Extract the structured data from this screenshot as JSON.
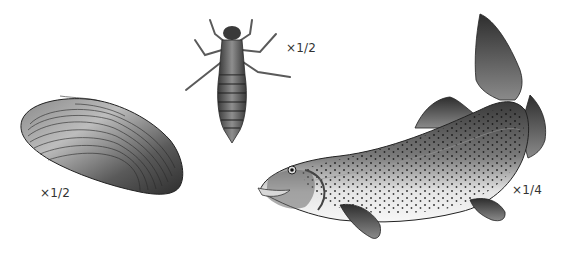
{
  "illustration": {
    "specimens": [
      {
        "name": "freshwater mussel / clam shell",
        "scale_label": "×1/2"
      },
      {
        "name": "aquatic insect nymph (dragonfly larva)",
        "scale_label": "×1/2"
      },
      {
        "name": "rainbow trout",
        "scale_label": "×1/4"
      }
    ],
    "colors": {
      "background": "#ffffff",
      "dark": "#2a2a2a",
      "mid": "#6a6a6a",
      "light": "#cfcfcf",
      "label_text": "#333333"
    }
  }
}
